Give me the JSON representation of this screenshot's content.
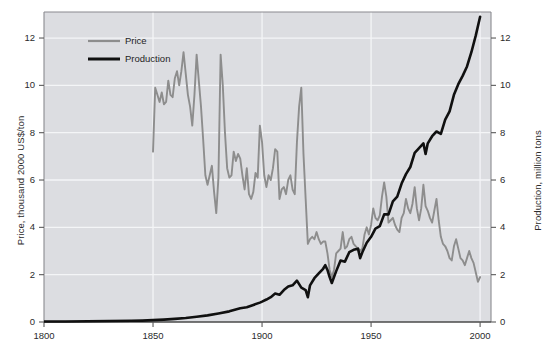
{
  "chart_data": {
    "type": "line",
    "title": "",
    "xlabel": "",
    "ylabel": "Price, thousand 2000 US$/ton",
    "ylabel_right": "Production, million tons",
    "xlim": [
      1800,
      2005
    ],
    "ylim": [
      0,
      13.1
    ],
    "grid": true,
    "legend_position": "top-left-inside",
    "xticks": [
      "1800",
      "1850",
      "1900",
      "1950",
      "2000"
    ],
    "xtick_values": [
      1800,
      1850,
      1900,
      1950,
      2000
    ],
    "yticks_left": [
      "0",
      "2",
      "4",
      "6",
      "8",
      "10",
      "12"
    ],
    "ytick_values_left": [
      0,
      2,
      4,
      6,
      8,
      10,
      12
    ],
    "yticks_right": [
      "0",
      "2",
      "4",
      "6",
      "8",
      "10",
      "12"
    ],
    "ytick_values_right": [
      0,
      2,
      4,
      6,
      8,
      10,
      12
    ],
    "colors": {
      "price": "#8d8d8d",
      "production": "#101010",
      "plot_background": "#dcdde1",
      "gridline": "#f4f5f7",
      "axis": "#8a8a90",
      "text": "#2b2b2b"
    },
    "series": [
      {
        "name": "Price",
        "axis": "left",
        "color": "#8d8d8d",
        "unit": "thousand 2000 US$/ton",
        "x": [
          1850,
          1851,
          1852,
          1853,
          1854,
          1855,
          1856,
          1857,
          1858,
          1859,
          1860,
          1861,
          1862,
          1863,
          1864,
          1865,
          1866,
          1867,
          1868,
          1869,
          1870,
          1871,
          1872,
          1873,
          1874,
          1875,
          1876,
          1877,
          1878,
          1879,
          1880,
          1881,
          1882,
          1883,
          1884,
          1885,
          1886,
          1887,
          1888,
          1889,
          1890,
          1891,
          1892,
          1893,
          1894,
          1895,
          1896,
          1897,
          1898,
          1899,
          1900,
          1901,
          1902,
          1903,
          1904,
          1905,
          1906,
          1907,
          1908,
          1909,
          1910,
          1911,
          1912,
          1913,
          1914,
          1915,
          1916,
          1917,
          1918,
          1919,
          1920,
          1921,
          1922,
          1923,
          1924,
          1925,
          1926,
          1927,
          1928,
          1929,
          1930,
          1931,
          1932,
          1933,
          1934,
          1935,
          1936,
          1937,
          1938,
          1939,
          1940,
          1941,
          1942,
          1943,
          1944,
          1945,
          1946,
          1947,
          1948,
          1949,
          1950,
          1951,
          1952,
          1953,
          1954,
          1955,
          1956,
          1957,
          1958,
          1959,
          1960,
          1961,
          1962,
          1963,
          1964,
          1965,
          1966,
          1967,
          1968,
          1969,
          1970,
          1971,
          1972,
          1973,
          1974,
          1975,
          1976,
          1977,
          1978,
          1979,
          1980,
          1981,
          1982,
          1983,
          1984,
          1985,
          1986,
          1987,
          1988,
          1989,
          1990,
          1991,
          1992,
          1993,
          1994,
          1995,
          1996,
          1997,
          1998,
          1999,
          2000
        ],
        "y": [
          7.2,
          9.9,
          9.6,
          9.3,
          9.7,
          9.2,
          9.3,
          10.2,
          9.6,
          9.5,
          10.3,
          10.6,
          10.0,
          10.6,
          11.4,
          10.5,
          9.6,
          9.1,
          8.3,
          9.6,
          11.3,
          10.2,
          9.1,
          7.7,
          6.2,
          5.8,
          6.2,
          6.6,
          5.5,
          4.6,
          6.1,
          11.3,
          10.0,
          8.0,
          6.5,
          6.1,
          6.2,
          7.2,
          6.8,
          7.1,
          6.9,
          6.2,
          5.6,
          6.5,
          5.4,
          5.2,
          5.5,
          6.3,
          6.1,
          8.3,
          7.6,
          6.2,
          5.7,
          6.2,
          6.0,
          6.5,
          7.3,
          7.2,
          5.2,
          5.6,
          5.7,
          5.4,
          6.0,
          6.2,
          5.6,
          5.4,
          7.6,
          9.1,
          9.9,
          7.1,
          5.2,
          3.3,
          3.5,
          3.6,
          3.5,
          3.8,
          3.5,
          3.3,
          3.4,
          3.4,
          2.9,
          2.2,
          1.9,
          2.2,
          2.9,
          3.0,
          3.1,
          3.8,
          3.1,
          3.2,
          3.5,
          3.6,
          3.3,
          3.2,
          3.1,
          3.0,
          3.1,
          3.7,
          4.0,
          3.7,
          4.1,
          4.8,
          4.4,
          4.3,
          4.5,
          5.3,
          5.9,
          5.3,
          4.2,
          4.3,
          4.4,
          4.1,
          3.9,
          3.8,
          4.4,
          4.6,
          5.2,
          4.8,
          4.6,
          5.0,
          5.7,
          4.8,
          4.3,
          4.8,
          5.8,
          4.9,
          4.7,
          4.4,
          4.2,
          4.7,
          5.2,
          4.3,
          3.6,
          3.3,
          3.2,
          3.0,
          2.7,
          2.6,
          3.2,
          3.5,
          3.1,
          2.7,
          2.6,
          2.4,
          2.7,
          3.0,
          2.7,
          2.5,
          2.1,
          1.7,
          1.9
        ]
      },
      {
        "name": "Production",
        "axis": "right",
        "color": "#101010",
        "unit": "million tons",
        "x": [
          1800,
          1810,
          1820,
          1830,
          1840,
          1845,
          1850,
          1855,
          1860,
          1865,
          1870,
          1875,
          1880,
          1885,
          1890,
          1893,
          1896,
          1899,
          1900,
          1902,
          1904,
          1906,
          1908,
          1910,
          1912,
          1914,
          1916,
          1918,
          1920,
          1921,
          1922,
          1924,
          1926,
          1928,
          1929,
          1930,
          1931,
          1932,
          1933,
          1934,
          1936,
          1938,
          1940,
          1942,
          1944,
          1945,
          1946,
          1948,
          1950,
          1952,
          1954,
          1956,
          1958,
          1960,
          1962,
          1964,
          1966,
          1968,
          1970,
          1972,
          1974,
          1975,
          1976,
          1978,
          1980,
          1982,
          1984,
          1986,
          1988,
          1990,
          1992,
          1994,
          1996,
          1998,
          2000
        ],
        "y": [
          0.02,
          0.02,
          0.03,
          0.04,
          0.05,
          0.06,
          0.08,
          0.1,
          0.13,
          0.17,
          0.22,
          0.28,
          0.36,
          0.45,
          0.58,
          0.62,
          0.72,
          0.82,
          0.86,
          0.95,
          1.05,
          1.2,
          1.15,
          1.35,
          1.5,
          1.55,
          1.75,
          1.45,
          1.35,
          1.05,
          1.55,
          1.85,
          2.05,
          2.25,
          2.4,
          2.2,
          1.9,
          1.65,
          1.9,
          2.15,
          2.6,
          2.55,
          2.95,
          3.05,
          3.1,
          2.7,
          2.95,
          3.35,
          3.6,
          3.95,
          4.05,
          4.55,
          4.55,
          5.1,
          5.3,
          5.85,
          6.25,
          6.55,
          7.15,
          7.35,
          7.55,
          7.1,
          7.55,
          7.85,
          8.05,
          7.95,
          8.55,
          8.9,
          9.6,
          10.05,
          10.4,
          10.8,
          11.4,
          12.1,
          12.9
        ]
      }
    ]
  },
  "axes": {
    "left_title": "Price, thousand 2000 US$/ton",
    "right_title": "Production, million tons",
    "x_ticks": [
      {
        "label": "1800",
        "value": 1800
      },
      {
        "label": "1850",
        "value": 1850
      },
      {
        "label": "1900",
        "value": 1900
      },
      {
        "label": "1950",
        "value": 1950
      },
      {
        "label": "2000",
        "value": 2000
      }
    ],
    "y_ticks_left": [
      {
        "label": "0",
        "value": 0
      },
      {
        "label": "2",
        "value": 2
      },
      {
        "label": "4",
        "value": 4
      },
      {
        "label": "6",
        "value": 6
      },
      {
        "label": "8",
        "value": 8
      },
      {
        "label": "10",
        "value": 10
      },
      {
        "label": "12",
        "value": 12
      }
    ],
    "y_ticks_right": [
      {
        "label": "0",
        "value": 0
      },
      {
        "label": "2",
        "value": 2
      },
      {
        "label": "4",
        "value": 4
      },
      {
        "label": "6",
        "value": 6
      },
      {
        "label": "8",
        "value": 8
      },
      {
        "label": "10",
        "value": 10
      },
      {
        "label": "12",
        "value": 12
      }
    ]
  },
  "legend": {
    "entries": [
      {
        "label": "Price",
        "color": "#8d8d8d",
        "width": 2.2
      },
      {
        "label": "Production",
        "color": "#101010",
        "width": 3.0
      }
    ]
  }
}
